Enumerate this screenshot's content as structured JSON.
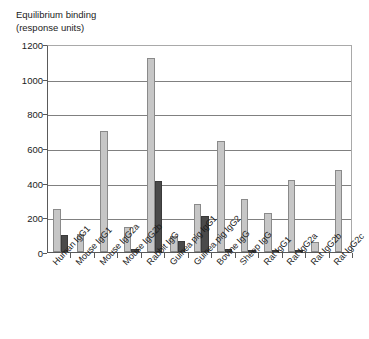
{
  "chart_data": {
    "type": "bar",
    "title": "Equilibrium binding (response units)",
    "title_lines": [
      "Equilibrium binding",
      "(response units)"
    ],
    "xlabel": "",
    "ylabel": "Equilibrium binding (response units)",
    "ylim": [
      0,
      1200
    ],
    "ytick_values": [
      0,
      200,
      400,
      600,
      800,
      1000,
      1200
    ],
    "ytick_labels": [
      "0",
      "200",
      "400",
      "600",
      "800",
      "1000",
      "1200"
    ],
    "grid": true,
    "legend": "none",
    "categories": [
      "Human IgG1",
      "Mouse IgG1",
      "Mouse IgG2a",
      "Mouse IgG2b",
      "Rabbit IgG",
      "Guinea pig IgG1",
      "Guinea pig IgG2",
      "Bovine IgG",
      "Sheep IgG",
      "Rat IgG1",
      "Rat IgG2a",
      "Rat IgG2b",
      "Rat IgG2c"
    ],
    "series": [
      {
        "name": "series-light",
        "color": "#c6c6c6",
        "values": [
          250,
          105,
          700,
          145,
          1120,
          90,
          275,
          640,
          305,
          225,
          418,
          60,
          475
        ]
      },
      {
        "name": "series-dark",
        "color": "#4a4a4a",
        "values": [
          100,
          0,
          0,
          18,
          410,
          65,
          205,
          18,
          10,
          12,
          12,
          0,
          0
        ]
      }
    ]
  },
  "colors": {
    "background": "#ffffff",
    "axis": "#5a5a5a",
    "gridline": "#808080",
    "bar_light": "#c6c6c6",
    "bar_dark": "#4a4a4a",
    "text": "#1b1b1b"
  }
}
